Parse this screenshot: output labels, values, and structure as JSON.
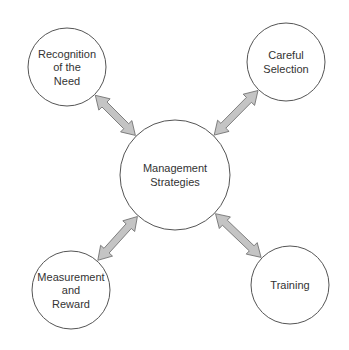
{
  "diagram": {
    "type": "hub-and-spoke",
    "center": {
      "id": "management",
      "lines": [
        "Management",
        "Strategies"
      ],
      "cx": 175,
      "cy": 175,
      "r": 55
    },
    "nodes": [
      {
        "id": "recognition",
        "lines": [
          "Recognition",
          "of the",
          "Need"
        ],
        "cx": 67,
        "cy": 67,
        "r": 39
      },
      {
        "id": "selection",
        "lines": [
          "Careful",
          "Selection"
        ],
        "cx": 286,
        "cy": 62,
        "r": 39
      },
      {
        "id": "measurement",
        "lines": [
          "Measurement",
          "and",
          "Reward"
        ],
        "cx": 71,
        "cy": 290,
        "r": 39
      },
      {
        "id": "training",
        "lines": [
          "Training"
        ],
        "cx": 290,
        "cy": 285,
        "r": 39
      }
    ],
    "edges": [
      {
        "from": "recognition",
        "to": "management",
        "style": "double-arrow"
      },
      {
        "from": "selection",
        "to": "management",
        "style": "double-arrow"
      },
      {
        "from": "measurement",
        "to": "management",
        "style": "double-arrow"
      },
      {
        "from": "training",
        "to": "management",
        "style": "double-arrow"
      }
    ],
    "colors": {
      "arrow_fill": "#c4c4c4",
      "arrow_stroke": "#666666",
      "circle_stroke": "#555555",
      "text": "#333333"
    }
  }
}
